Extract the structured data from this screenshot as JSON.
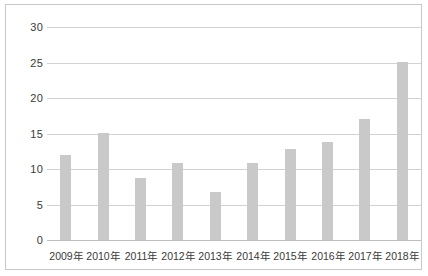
{
  "chart_data": {
    "type": "bar",
    "title": "",
    "subtitle": "",
    "xlabel": "",
    "ylabel": "",
    "categories": [
      "2009年",
      "2010年",
      "2011年",
      "2012年",
      "2013年",
      "2014年",
      "2015年",
      "2016年",
      "2017年",
      "2018年"
    ],
    "values": [
      12,
      15,
      8.8,
      10.8,
      6.8,
      10.9,
      12.8,
      13.8,
      17,
      25
    ],
    "series": [
      {
        "name": "",
        "values": [
          12,
          15,
          8.8,
          10.8,
          6.8,
          10.9,
          12.8,
          13.8,
          17,
          25
        ]
      }
    ],
    "ylim": [
      0,
      30
    ],
    "yticks": [
      0,
      5,
      10,
      15,
      20,
      25,
      30
    ],
    "ytick_labels": [
      "0",
      "5",
      "10",
      "15",
      "20",
      "25",
      "30"
    ],
    "grid": true,
    "grid_axis": "y",
    "legend": false,
    "legend_position": "none",
    "bar_color": "#c9c9c9",
    "gridline_color": "#d2d2d2",
    "axis_text_color": "#3a3a3a",
    "border_color": "#c8c8c8",
    "background_color": "#ffffff"
  }
}
